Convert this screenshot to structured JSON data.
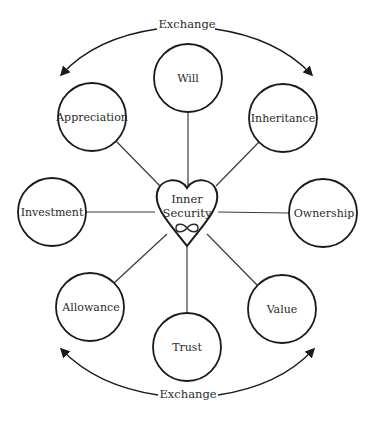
{
  "diagram": {
    "center": {
      "line1": "Inner",
      "line2": "Security",
      "symbol": "∞",
      "shape": "heart"
    },
    "nodes": [
      {
        "label": "Will"
      },
      {
        "label": "Inheritance"
      },
      {
        "label": "Ownership"
      },
      {
        "label": "Value"
      },
      {
        "label": "Trust"
      },
      {
        "label": "Allowance"
      },
      {
        "label": "Investment"
      },
      {
        "label": "Appreciation"
      }
    ],
    "arcs": {
      "top_label": "Exchange",
      "bottom_label": "Exchange"
    },
    "colors": {
      "stroke": "#1a1a1a",
      "connector": "#3a3a3a",
      "background": "#ffffff"
    }
  }
}
